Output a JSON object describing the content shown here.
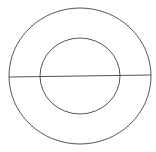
{
  "diagram": {
    "stroke_color": "#555555",
    "background": "#ffffff",
    "shapes": {
      "outer_circle": {
        "cx": 80,
        "cy": 76,
        "rx": 71,
        "ry": 68
      },
      "inner_circle": {
        "cx": 80,
        "cy": 76,
        "rx": 40,
        "ry": 38
      },
      "diameter_line": {
        "x1": 9,
        "y1": 77,
        "x2": 151,
        "y2": 75
      }
    }
  }
}
